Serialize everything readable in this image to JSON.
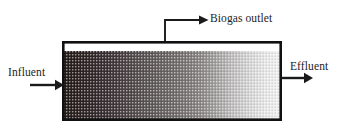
{
  "diagram": {
    "vessel": {
      "name": "reactor-vessel",
      "x": 62,
      "y": 41,
      "width": 220,
      "height": 80,
      "headspace_height": 10,
      "border_color": "#111111"
    },
    "labels": {
      "influent": "Influent",
      "effluent": "Effluent",
      "biogas_outlet": "Biogas outlet"
    },
    "arrows": {
      "influent": {
        "name": "influent-arrow",
        "x1": 30,
        "y1": 85,
        "x2": 62,
        "y2": 85,
        "direction": "right"
      },
      "effluent": {
        "name": "effluent-arrow",
        "x1": 282,
        "y1": 78,
        "x2": 312,
        "y2": 78,
        "direction": "right"
      },
      "biogas": {
        "name": "biogas-outlet-arrow",
        "riser_x": 165,
        "riser_top_y": 20,
        "riser_bottom_y": 41,
        "horizontal_end_x": 203,
        "direction": "right"
      }
    },
    "label_positions": {
      "influent": {
        "x": 8,
        "y": 76
      },
      "effluent": {
        "x": 290,
        "y": 70
      },
      "biogas_outlet": {
        "x": 210,
        "y": 22
      }
    },
    "sludge_gradient": {
      "description": "Stippled sludge bed shading from dense dark at the influent end to sparse light at the effluent end",
      "pattern": "dotted-stipple",
      "bands": [
        {
          "offset": 0.0,
          "color": "#241c1a"
        },
        {
          "offset": 0.06,
          "color": "#2b2220"
        },
        {
          "offset": 0.13,
          "color": "#32282a"
        },
        {
          "offset": 0.21,
          "color": "#3c3336"
        },
        {
          "offset": 0.28,
          "color": "#4a4144"
        },
        {
          "offset": 0.35,
          "color": "#575051"
        },
        {
          "offset": 0.42,
          "color": "#625b5c"
        },
        {
          "offset": 0.5,
          "color": "#6f6a6a"
        },
        {
          "offset": 0.57,
          "color": "#7d7878"
        },
        {
          "offset": 0.64,
          "color": "#8e8a8a"
        },
        {
          "offset": 0.7,
          "color": "#a3a0a0"
        },
        {
          "offset": 0.78,
          "color": "#c2c0c0"
        },
        {
          "offset": 0.86,
          "color": "#d9d8d8"
        },
        {
          "offset": 0.93,
          "color": "#e9e9e9"
        },
        {
          "offset": 1.0,
          "color": "#f2f2f2"
        }
      ]
    }
  }
}
